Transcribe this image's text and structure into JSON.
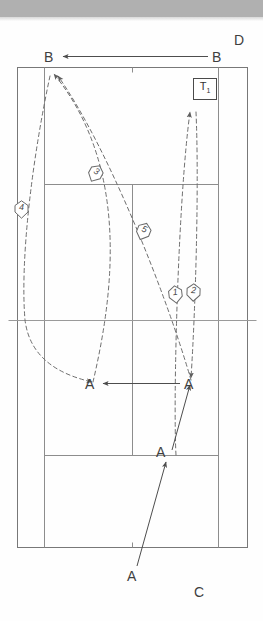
{
  "diagram": {
    "type": "tennis-court-tactics",
    "court_orientation": "vertical",
    "corner_labels": {
      "top_right": "D",
      "bottom_right": "C"
    },
    "server_box": {
      "label": "T",
      "subscript": "1"
    },
    "player_labels": {
      "b_left": "B",
      "b_right": "B",
      "a_mid_left": "A",
      "a_mid_right": "A",
      "a_service": "A",
      "a_baseline": "A"
    },
    "shot_markers": [
      {
        "id": "1",
        "number": "1",
        "x": 168,
        "y": 285,
        "rotation": -7
      },
      {
        "id": "2",
        "number": "2",
        "x": 186,
        "y": 283,
        "rotation": 2
      },
      {
        "id": "3",
        "number": "3",
        "x": 88,
        "y": 164,
        "rotation": 28
      },
      {
        "id": "4",
        "number": "4",
        "x": 14,
        "y": 200,
        "rotation": 0
      },
      {
        "id": "5",
        "number": "5",
        "x": 136,
        "y": 222,
        "rotation": 22
      }
    ],
    "legend_note": {
      "ball_path": "dashed line = ball trajectory",
      "player_path": "solid line = player movement"
    },
    "colors": {
      "court_line": "#8d8d8d",
      "ball_path": "#6e6e6e",
      "player_path": "#4d4d4d",
      "text": "#3f3f3f",
      "scan_band": "#b0b0b0",
      "page": "#fefefe"
    },
    "court_geometry": {
      "outer_left": 17,
      "outer_right": 248,
      "singles_left": 44,
      "singles_right": 218,
      "center_x": 132,
      "baseline_top": 67,
      "baseline_bottom": 547,
      "service_line_top": 184,
      "service_line_bottom": 455,
      "net_y": 320
    }
  }
}
